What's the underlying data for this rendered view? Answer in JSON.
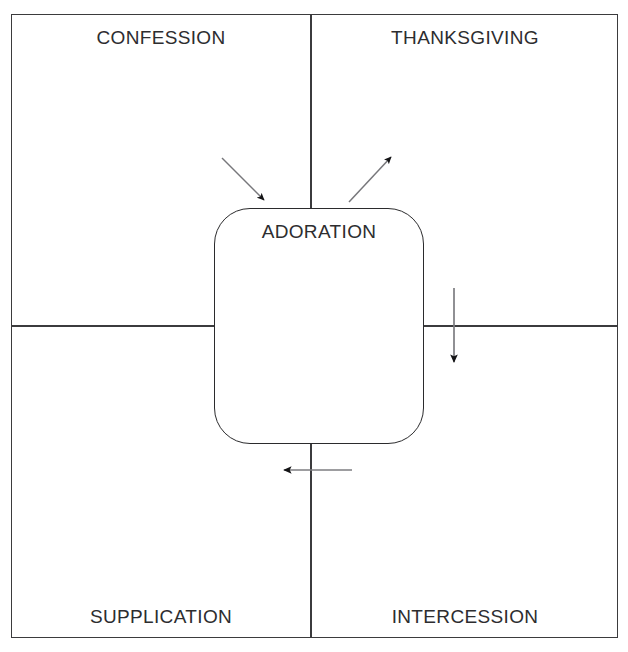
{
  "document": {
    "title": "Prayer Quadrant Diagram",
    "top_clipped_text": "·  ·   ·    ·     ·      ·       ·        ·         ·          ·"
  },
  "diagram": {
    "type": "quadrant-flow",
    "center": {
      "label": "ADORATION",
      "shape": "rounded-rectangle"
    },
    "quadrants": [
      {
        "position": "top-left",
        "label": "CONFESSION"
      },
      {
        "position": "top-right",
        "label": "THANKSGIVING"
      },
      {
        "position": "bottom-left",
        "label": "SUPPLICATION"
      },
      {
        "position": "bottom-right",
        "label": "INTERCESSION"
      }
    ],
    "arrows": [
      {
        "name": "confession-to-adoration",
        "direction": "down-right",
        "style": "diagonal"
      },
      {
        "name": "adoration-to-thanksgiving",
        "direction": "up-right",
        "style": "diagonal"
      },
      {
        "name": "thanksgiving-to-intercession",
        "direction": "down",
        "style": "vertical"
      },
      {
        "name": "intercession-to-supplication",
        "direction": "left",
        "style": "horizontal"
      }
    ],
    "colors": {
      "frame_line": "#3b3b3d",
      "center_box_line": "#2b2b2d",
      "arrow": "#6f6f72",
      "arrow_head": "#1a1a1a",
      "text": "#2d2d2f",
      "background": "#ffffff"
    }
  }
}
